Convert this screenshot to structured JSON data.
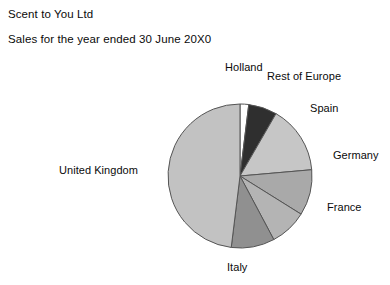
{
  "header": {
    "company": "Scent to You Ltd",
    "subtitle": "Sales for the year ended 30 June 20X0"
  },
  "labels": {
    "holland": "Holland",
    "rest_of_europe": "Rest of Europe",
    "spain": "Spain",
    "germany": "Germany",
    "france": "France",
    "italy": "Italy",
    "united_kingdom": "United Kingdom"
  },
  "chart_data": {
    "type": "pie",
    "title": "Sales for the year ended 30 June 20X0",
    "subtitle": "Scent to You Ltd",
    "xlabel": "",
    "ylabel": "",
    "legend": "none",
    "grid": false,
    "start_angle_deg": 0,
    "direction": "clockwise",
    "categories": [
      "Holland",
      "Rest of Europe",
      "Spain",
      "Germany",
      "France",
      "Italy",
      "United Kingdom"
    ],
    "values": [
      1.9,
      6.4,
      15.3,
      10.3,
      8.3,
      9.7,
      48.1
    ],
    "units": "percent",
    "slices": [
      {
        "label": "Holland",
        "percent": 1.9,
        "start_deg": 0,
        "end_deg": 7,
        "color": "#ffffff"
      },
      {
        "label": "Rest of Europe",
        "percent": 6.4,
        "start_deg": 7,
        "end_deg": 30,
        "color": "#2f2f2f"
      },
      {
        "label": "Spain",
        "percent": 15.3,
        "start_deg": 30,
        "end_deg": 85,
        "color": "#c6c6c6"
      },
      {
        "label": "Germany",
        "percent": 10.3,
        "start_deg": 85,
        "end_deg": 122,
        "color": "#a9a9a9"
      },
      {
        "label": "France",
        "percent": 8.3,
        "start_deg": 122,
        "end_deg": 152,
        "color": "#b4b4b4"
      },
      {
        "label": "Italy",
        "percent": 9.7,
        "start_deg": 152,
        "end_deg": 187,
        "color": "#909090"
      },
      {
        "label": "United Kingdom",
        "percent": 48.1,
        "start_deg": 187,
        "end_deg": 360,
        "color": "#c2c2c2"
      }
    ],
    "geometry": {
      "center_x": 240,
      "center_y": 121,
      "radius": 72
    },
    "outline_color": "#555555"
  }
}
